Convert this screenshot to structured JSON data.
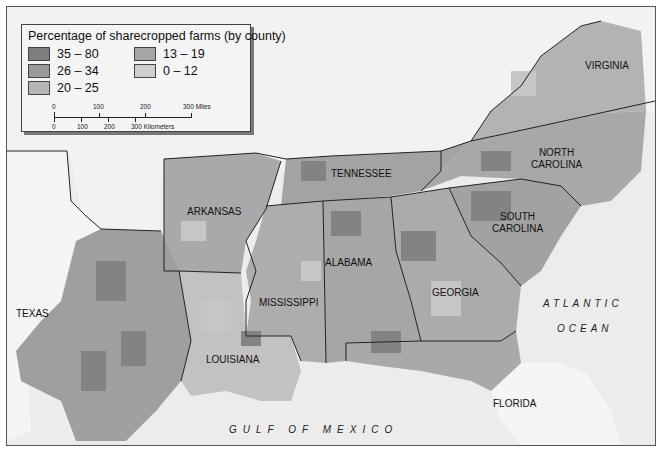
{
  "legend": {
    "title": "Percentage of sharecropped farms (by county)",
    "items": [
      {
        "range": "35 – 80",
        "color": "#7d7d7d"
      },
      {
        "range": "26 – 34",
        "color": "#9a9a9a"
      },
      {
        "range": "20 – 25",
        "color": "#b5b5b5"
      },
      {
        "range": "13 – 19",
        "color": "#a6a6a6"
      },
      {
        "range": "0 – 12",
        "color": "#cfcfcf"
      }
    ],
    "scale": {
      "miles": [
        "0",
        "100",
        "200",
        "300 Miles"
      ],
      "kilometers": [
        "0",
        "100",
        "200",
        "300 Kilometers"
      ]
    }
  },
  "states": {
    "virginia": "VIRGINIA",
    "north_carolina": "NORTH\nCAROLINA",
    "tennessee": "TENNESSEE",
    "arkansas": "ARKANSAS",
    "south_carolina": "SOUTH\nCAROLINA",
    "alabama": "ALABAMA",
    "mississippi": "MISSISSIPPI",
    "georgia": "GEORGIA",
    "texas": "TEXAS",
    "louisiana": "LOUISIANA",
    "florida": "FLORIDA"
  },
  "water": {
    "atlantic_line1": "ATLANTIC",
    "atlantic_line2": "OCEAN",
    "gulf": "GULF OF MEXICO"
  },
  "colors": {
    "land_unshaded": "#f4f4f4",
    "water": "#ececec",
    "border": "#222222"
  }
}
